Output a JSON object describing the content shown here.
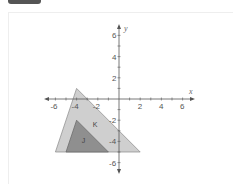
{
  "header": {
    "tab_label": ""
  },
  "graph": {
    "x_axis_label": "x",
    "y_axis_label": "y",
    "x_ticks": [
      {
        "value": -6,
        "label": "-6"
      },
      {
        "value": -4,
        "label": "-4"
      },
      {
        "value": -2,
        "label": "-2"
      },
      {
        "value": 2,
        "label": "2"
      },
      {
        "value": 4,
        "label": "4"
      },
      {
        "value": 6,
        "label": "6"
      }
    ],
    "y_ticks": [
      {
        "value": 6,
        "label": "6"
      },
      {
        "value": 4,
        "label": "4"
      },
      {
        "value": 2,
        "label": "2"
      },
      {
        "value": -2,
        "label": "-2"
      },
      {
        "value": -4,
        "label": "-4"
      },
      {
        "value": -6,
        "label": "-6"
      }
    ],
    "shapes": [
      {
        "name": "K",
        "label": "K",
        "vertices": [
          [
            -4,
            1
          ],
          [
            -6,
            -5
          ],
          [
            2,
            -5
          ]
        ],
        "fill": "#cfcfcf",
        "stroke": "#888888"
      },
      {
        "name": "J",
        "label": "J",
        "vertices": [
          [
            -4,
            -2
          ],
          [
            -5,
            -5
          ],
          [
            -1,
            -5
          ]
        ],
        "fill": "#8f8f8f",
        "stroke": "#666666"
      }
    ],
    "colors": {
      "axis": "#555555",
      "background": "#ffffff"
    }
  }
}
